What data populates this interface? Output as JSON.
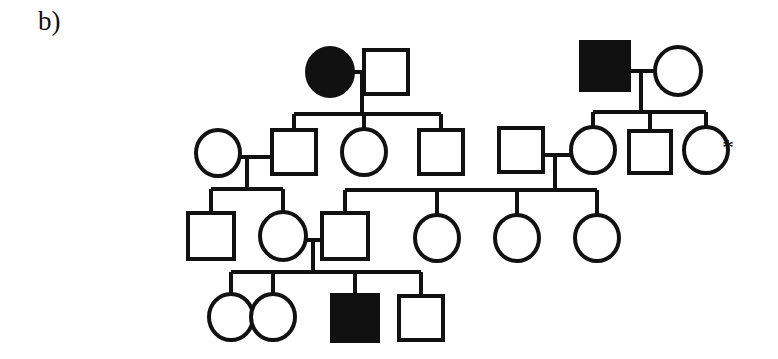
{
  "figure": {
    "panel_label": "b)",
    "type": "pedigree-chart",
    "stroke_color": "#111111",
    "fill_affected_color": "#111111",
    "fill_unaffected_color": "#ffffff",
    "background_color": "#ffffff",
    "symbol_legend": {
      "square": "male",
      "circle": "female",
      "filled": "affected",
      "open": "unaffected",
      "asterisk": "proband-or-consultand-marker"
    }
  },
  "annotations": [
    {
      "name": "asterisk-marker",
      "text": "*",
      "x": 722,
      "y": 135,
      "refers_to": "gen2-individual-8"
    }
  ],
  "chart_data": {
    "type": "pedigree",
    "generations": 4,
    "individuals": [
      {
        "id": "I-1",
        "name": "gen1-individual-1",
        "shape": "circle",
        "sex": "female",
        "affected": true,
        "cx": 330,
        "cy": 72,
        "r": 23,
        "generation": 1
      },
      {
        "id": "I-2",
        "name": "gen1-individual-2",
        "shape": "square",
        "sex": "male",
        "affected": false,
        "cx": 386,
        "cy": 72,
        "r": 22,
        "generation": 1
      },
      {
        "id": "I-3",
        "name": "gen1-individual-3",
        "shape": "square",
        "sex": "male",
        "affected": true,
        "cx": 605,
        "cy": 66,
        "r": 24,
        "generation": 1
      },
      {
        "id": "I-4",
        "name": "gen1-individual-4",
        "shape": "circle",
        "sex": "female",
        "affected": false,
        "cx": 678,
        "cy": 71,
        "r": 23,
        "generation": 1
      },
      {
        "id": "II-1",
        "name": "gen2-individual-1",
        "shape": "circle",
        "sex": "female",
        "affected": false,
        "cx": 218,
        "cy": 153,
        "r": 22,
        "generation": 2
      },
      {
        "id": "II-2",
        "name": "gen2-individual-2",
        "shape": "square",
        "sex": "male",
        "affected": false,
        "cx": 294,
        "cy": 152,
        "r": 22,
        "generation": 2
      },
      {
        "id": "II-3",
        "name": "gen2-individual-3",
        "shape": "circle",
        "sex": "female",
        "affected": false,
        "cx": 364,
        "cy": 152,
        "r": 22,
        "generation": 2
      },
      {
        "id": "II-4",
        "name": "gen2-individual-4",
        "shape": "square",
        "sex": "male",
        "affected": false,
        "cx": 441,
        "cy": 152,
        "r": 22,
        "generation": 2
      },
      {
        "id": "II-5",
        "name": "gen2-individual-5",
        "shape": "square",
        "sex": "male",
        "affected": false,
        "cx": 521,
        "cy": 150,
        "r": 22,
        "generation": 2
      },
      {
        "id": "II-6",
        "name": "gen2-individual-6",
        "shape": "circle",
        "sex": "female",
        "affected": false,
        "cx": 593,
        "cy": 150,
        "r": 22,
        "generation": 2
      },
      {
        "id": "II-7",
        "name": "gen2-individual-7",
        "shape": "square",
        "sex": "male",
        "affected": false,
        "cx": 650,
        "cy": 152,
        "r": 21,
        "generation": 2
      },
      {
        "id": "II-8",
        "name": "gen2-individual-8",
        "shape": "circle",
        "sex": "female",
        "affected": false,
        "cx": 706,
        "cy": 150,
        "r": 22,
        "generation": 2
      },
      {
        "id": "III-1",
        "name": "gen3-individual-1",
        "shape": "square",
        "sex": "male",
        "affected": false,
        "cx": 211,
        "cy": 236,
        "r": 23,
        "generation": 3
      },
      {
        "id": "III-2",
        "name": "gen3-individual-2",
        "shape": "circle",
        "sex": "female",
        "affected": false,
        "cx": 283,
        "cy": 236,
        "r": 23,
        "generation": 3
      },
      {
        "id": "III-3",
        "name": "gen3-individual-3",
        "shape": "square",
        "sex": "male",
        "affected": false,
        "cx": 345,
        "cy": 236,
        "r": 23,
        "generation": 3
      },
      {
        "id": "III-4",
        "name": "gen3-individual-4",
        "shape": "circle",
        "sex": "female",
        "affected": false,
        "cx": 437,
        "cy": 238,
        "r": 22,
        "generation": 3
      },
      {
        "id": "III-5",
        "name": "gen3-individual-5",
        "shape": "circle",
        "sex": "female",
        "affected": false,
        "cx": 517,
        "cy": 238,
        "r": 22,
        "generation": 3
      },
      {
        "id": "III-6",
        "name": "gen3-individual-6",
        "shape": "circle",
        "sex": "female",
        "affected": false,
        "cx": 597,
        "cy": 238,
        "r": 22,
        "generation": 3
      },
      {
        "id": "IV-1",
        "name": "gen4-individual-1",
        "shape": "circle",
        "sex": "female",
        "affected": false,
        "cx": 231,
        "cy": 317,
        "r": 22,
        "generation": 4
      },
      {
        "id": "IV-2",
        "name": "gen4-individual-2",
        "shape": "circle",
        "sex": "female",
        "affected": false,
        "cx": 273,
        "cy": 317,
        "r": 22,
        "generation": 4
      },
      {
        "id": "IV-3",
        "name": "gen4-individual-3",
        "shape": "square",
        "sex": "male",
        "affected": true,
        "cx": 355,
        "cy": 318,
        "r": 23,
        "generation": 4
      },
      {
        "id": "IV-4",
        "name": "gen4-individual-4",
        "shape": "square",
        "sex": "male",
        "affected": false,
        "cx": 421,
        "cy": 318,
        "r": 22,
        "generation": 4
      }
    ],
    "matings": [
      {
        "name": "mating-line-gen1-left",
        "x1": 353,
        "y1": 72,
        "x2": 364,
        "y2": 72
      },
      {
        "name": "mating-line-gen1-right",
        "x1": 629,
        "y1": 71,
        "x2": 655,
        "y2": 71
      },
      {
        "name": "mating-line-gen2-left",
        "x1": 240,
        "y1": 157,
        "x2": 272,
        "y2": 157
      },
      {
        "name": "mating-line-gen2-right",
        "x1": 543,
        "y1": 155,
        "x2": 571,
        "y2": 155
      },
      {
        "name": "mating-line-gen3",
        "x1": 306,
        "y1": 240,
        "x2": 322,
        "y2": 240
      }
    ],
    "descent_lines": [
      {
        "name": "descent-gen1-left",
        "x": 362,
        "y1": 72,
        "y2": 114
      },
      {
        "name": "descent-gen1-right",
        "x": 641,
        "y1": 71,
        "y2": 112
      },
      {
        "name": "descent-gen2-left",
        "x": 247,
        "y1": 157,
        "y2": 189
      },
      {
        "name": "descent-gen2-right",
        "x": 555,
        "y1": 155,
        "y2": 190
      },
      {
        "name": "descent-gen3",
        "x": 313,
        "y1": 240,
        "y2": 272
      }
    ],
    "sibship_lines": [
      {
        "name": "sibship-line-gen2-left",
        "y": 114,
        "x1": 294,
        "x2": 441,
        "drops": [
          294,
          364,
          441
        ]
      },
      {
        "name": "sibship-line-gen2-right",
        "y": 112,
        "x1": 593,
        "x2": 706,
        "drops": [
          593,
          650,
          706
        ]
      },
      {
        "name": "sibship-line-gen3-left",
        "y": 189,
        "x1": 211,
        "x2": 283,
        "drops": [
          211,
          283
        ]
      },
      {
        "name": "sibship-line-gen3-right",
        "y": 190,
        "x1": 345,
        "x2": 597,
        "drops": [
          345,
          437,
          517,
          597
        ]
      },
      {
        "name": "sibship-line-gen4",
        "y": 272,
        "x1": 231,
        "x2": 421,
        "drops": [
          231,
          273,
          355,
          421
        ]
      }
    ]
  }
}
